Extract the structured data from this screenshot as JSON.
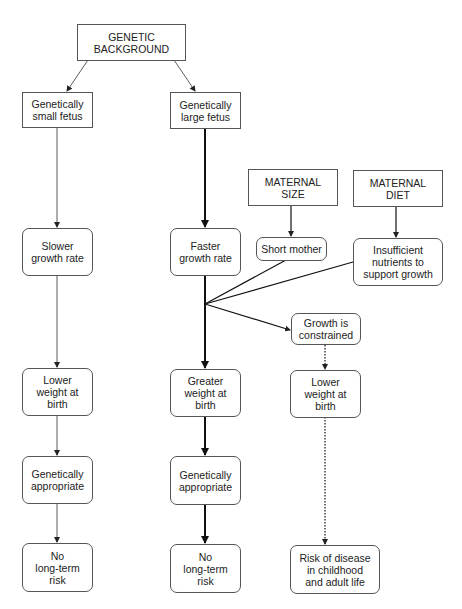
{
  "diagram": {
    "nodes": {
      "genetic_background": "GENETIC\nBACKGROUND",
      "small_fetus": "Genetically\nsmall fetus",
      "large_fetus": "Genetically\nlarge fetus",
      "maternal_size": "MATERNAL\nSIZE",
      "maternal_diet": "MATERNAL\nDIET",
      "short_mother": "Short mother",
      "insufficient_nutrients": "Insufficient\nnutrients to\nsupport growth",
      "slower_growth": "Slower\ngrowth rate",
      "faster_growth": "Faster\ngrowth rate",
      "growth_constrained": "Growth is\nconstrained",
      "lower_weight_left": "Lower\nweight at\nbirth",
      "greater_weight": "Greater\nweight at\nbirth",
      "lower_weight_right": "Lower\nweight at\nbirth",
      "appropriate_left": "Genetically\nappropriate",
      "appropriate_center": "Genetically\nappropriate",
      "no_risk_left": "No\nlong-term\nrisk",
      "no_risk_center": "No\nlong-term\nrisk",
      "risk_disease": "Risk of disease\nin childhood\nand adult life"
    },
    "colors": {
      "line": "#222222",
      "border": "#555555"
    }
  }
}
